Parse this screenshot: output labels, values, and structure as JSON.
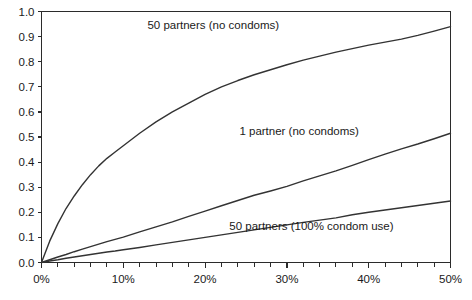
{
  "chart_data": {
    "type": "line",
    "title": "",
    "subtitle": "",
    "xlabel": "",
    "ylabel": "",
    "xlim": [
      0,
      50
    ],
    "ylim": [
      0,
      1.0
    ],
    "grid": false,
    "legend_position": "inline-annotations",
    "x_tick_labels": [
      "0%",
      "10%",
      "20%",
      "30%",
      "40%",
      "50%"
    ],
    "x_tick_values": [
      0,
      10,
      20,
      30,
      40,
      50
    ],
    "x_minor_tick_step": 2,
    "y_tick_labels": [
      "0.0",
      "0.1",
      "0.2",
      "0.3",
      "0.4",
      "0.5",
      "0.6",
      "0.7",
      "0.8",
      "0.9",
      "1.0"
    ],
    "y_tick_values": [
      0.0,
      0.1,
      0.2,
      0.3,
      0.4,
      0.5,
      0.6,
      0.7,
      0.8,
      0.9,
      1.0
    ],
    "x": [
      0,
      1,
      2,
      3,
      4,
      5,
      6,
      7,
      8,
      9,
      10,
      12,
      14,
      16,
      18,
      20,
      22,
      24,
      26,
      28,
      30,
      32,
      34,
      36,
      38,
      40,
      42,
      44,
      46,
      48,
      50
    ],
    "series": [
      {
        "name": "50 partners (no condoms)",
        "color": "#333333",
        "values": [
          0.0,
          0.085,
          0.155,
          0.215,
          0.265,
          0.31,
          0.35,
          0.385,
          0.415,
          0.44,
          0.465,
          0.515,
          0.56,
          0.6,
          0.635,
          0.67,
          0.7,
          0.725,
          0.748,
          0.768,
          0.788,
          0.806,
          0.822,
          0.838,
          0.852,
          0.866,
          0.878,
          0.89,
          0.905,
          0.922,
          0.94
        ],
        "annotation": {
          "text": "50 partners (no condoms)",
          "x": 21,
          "y": 0.945
        }
      },
      {
        "name": "1 partner (no condoms)",
        "color": "#333333",
        "values": [
          0.0,
          0.011,
          0.022,
          0.032,
          0.043,
          0.053,
          0.063,
          0.073,
          0.083,
          0.092,
          0.101,
          0.122,
          0.142,
          0.162,
          0.184,
          0.205,
          0.226,
          0.247,
          0.268,
          0.285,
          0.303,
          0.325,
          0.345,
          0.365,
          0.387,
          0.41,
          0.432,
          0.453,
          0.472,
          0.493,
          0.515
        ],
        "annotation": {
          "text": "1 partner (no condoms)",
          "x": 31.5,
          "y": 0.525
        }
      },
      {
        "name": "50 partners (100% condom use)",
        "color": "#333333",
        "values": [
          0.0,
          0.006,
          0.011,
          0.017,
          0.022,
          0.027,
          0.032,
          0.037,
          0.042,
          0.046,
          0.051,
          0.06,
          0.07,
          0.08,
          0.09,
          0.1,
          0.11,
          0.12,
          0.13,
          0.14,
          0.15,
          0.16,
          0.169,
          0.178,
          0.19,
          0.2,
          0.209,
          0.218,
          0.227,
          0.236,
          0.245
        ],
        "annotation": {
          "text": "50 partners (100% condom use)",
          "x": 33,
          "y": 0.145
        }
      }
    ]
  }
}
